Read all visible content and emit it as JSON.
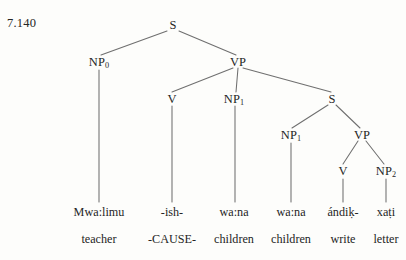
{
  "figure": {
    "example_number": "7.140",
    "background_color": "#fdfdfb",
    "line_color": "#6f6f6f",
    "text_color": "#252525"
  },
  "nodes": {
    "s_root": {
      "label": "S",
      "sub": "",
      "x": 173,
      "y": 25
    },
    "np0": {
      "label": "NP",
      "sub": "0",
      "x": 99,
      "y": 62
    },
    "vp_main": {
      "label": "VP",
      "sub": "",
      "x": 238,
      "y": 62
    },
    "v_main": {
      "label": "V",
      "sub": "",
      "x": 172,
      "y": 99
    },
    "np1_main": {
      "label": "NP",
      "sub": "1",
      "x": 234,
      "y": 99
    },
    "s_embedded": {
      "label": "S",
      "sub": "",
      "x": 332,
      "y": 99
    },
    "np1_emb": {
      "label": "NP",
      "sub": "1",
      "x": 291,
      "y": 135
    },
    "vp_emb": {
      "label": "VP",
      "sub": "",
      "x": 362,
      "y": 135
    },
    "v_emb": {
      "label": "V",
      "sub": "",
      "x": 343,
      "y": 171
    },
    "np2_emb": {
      "label": "NP",
      "sub": "2",
      "x": 386,
      "y": 171
    }
  },
  "morphemes": [
    {
      "text": "Mwa:limu",
      "x": 99,
      "y": 212
    },
    {
      "text": "-ish-",
      "x": 172,
      "y": 212
    },
    {
      "text": "wa:na",
      "x": 234,
      "y": 212
    },
    {
      "text": "wa:na",
      "x": 291,
      "y": 212
    },
    {
      "text": "ándiḳ-",
      "x": 343,
      "y": 212
    },
    {
      "text": "xaṭi",
      "x": 386,
      "y": 212
    }
  ],
  "glosses": [
    {
      "text": "teacher",
      "x": 99,
      "y": 239
    },
    {
      "text": "-CAUSE-",
      "x": 172,
      "y": 239
    },
    {
      "text": "children",
      "x": 234,
      "y": 239
    },
    {
      "text": "children",
      "x": 291,
      "y": 239
    },
    {
      "text": "write",
      "x": 343,
      "y": 239
    },
    {
      "text": "letter",
      "x": 386,
      "y": 239
    }
  ],
  "branches": [
    {
      "name": "s-root-to-np0",
      "x1": 167,
      "y1": 31,
      "x2": 101,
      "y2": 55
    },
    {
      "name": "s-root-to-vp-main",
      "x1": 179,
      "y1": 31,
      "x2": 236,
      "y2": 55
    },
    {
      "name": "vp-main-to-v",
      "x1": 233,
      "y1": 68,
      "x2": 172,
      "y2": 92
    },
    {
      "name": "vp-main-to-np1",
      "x1": 238,
      "y1": 68,
      "x2": 236,
      "y2": 92
    },
    {
      "name": "vp-main-to-s-emb",
      "x1": 243,
      "y1": 68,
      "x2": 331,
      "y2": 92
    },
    {
      "name": "s-emb-to-np1-emb",
      "x1": 328,
      "y1": 105,
      "x2": 292,
      "y2": 128
    },
    {
      "name": "s-emb-to-vp-emb",
      "x1": 336,
      "y1": 105,
      "x2": 360,
      "y2": 128
    },
    {
      "name": "vp-emb-to-v-emb",
      "x1": 358,
      "y1": 141,
      "x2": 343,
      "y2": 164
    },
    {
      "name": "vp-emb-to-np2-emb",
      "x1": 366,
      "y1": 141,
      "x2": 384,
      "y2": 164
    }
  ],
  "stems": [
    {
      "name": "np0-to-mwalimu",
      "x1": 99,
      "y1": 70,
      "x2": 99,
      "y2": 202
    },
    {
      "name": "v-main-to-ish",
      "x1": 172,
      "y1": 106,
      "x2": 172,
      "y2": 202
    },
    {
      "name": "np1-main-to-wana",
      "x1": 235,
      "y1": 106,
      "x2": 235,
      "y2": 202
    },
    {
      "name": "np1-emb-to-wana",
      "x1": 291,
      "y1": 143,
      "x2": 291,
      "y2": 202
    },
    {
      "name": "v-emb-to-andik",
      "x1": 343,
      "y1": 179,
      "x2": 343,
      "y2": 202
    },
    {
      "name": "np2-emb-to-xati",
      "x1": 386,
      "y1": 179,
      "x2": 386,
      "y2": 202
    }
  ]
}
